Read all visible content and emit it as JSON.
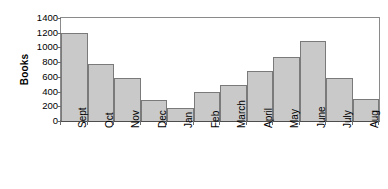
{
  "chart_data": {
    "type": "bar",
    "title": "",
    "xlabel": "",
    "ylabel": "Books",
    "categories": [
      "Sept",
      "Oct",
      "Nov",
      "Dec",
      "Jan",
      "Feb",
      "March",
      "April",
      "May",
      "June",
      "July",
      "Aug"
    ],
    "values": [
      1200,
      780,
      580,
      290,
      180,
      390,
      490,
      680,
      870,
      1090,
      580,
      300
    ],
    "ylim": [
      0,
      1400
    ],
    "ytick_values": [
      0,
      200,
      400,
      600,
      800,
      1000,
      1200,
      1400
    ],
    "ytick_labels": [
      "0",
      "200",
      "400",
      "600",
      "800",
      "1000",
      "1200",
      "1400"
    ],
    "grid": false,
    "legend": null,
    "series": [
      {
        "name": "Books",
        "values": [
          1200,
          780,
          580,
          290,
          180,
          390,
          490,
          680,
          870,
          1090,
          580,
          300
        ]
      }
    ],
    "colors": {
      "bar_fill": "#c9c9c9",
      "bar_border": "#7a7a7a",
      "axis": "#4d4d4d",
      "frame": "#8a8a8a",
      "text": "#000000",
      "background": "#ffffff"
    }
  }
}
